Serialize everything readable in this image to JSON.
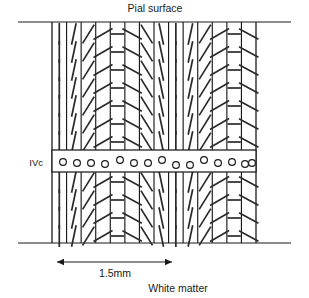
{
  "figure": {
    "title_top": "Pial surface",
    "title_bottom": "White matter",
    "layer_label": "IVc",
    "scale_label": "1.5mm",
    "colors": {
      "ink": "#1a1a1a",
      "tick": "#2a2a2a",
      "background": "#ffffff"
    }
  },
  "chart_data": {
    "type": "diagram",
    "xlabel": "1.5mm",
    "ylabel": "",
    "grid": false,
    "legend": null,
    "block": {
      "x_left": 52,
      "x_right": 256,
      "y_top": 22,
      "y_bottom": 243,
      "column_count": 14,
      "column_width_px": 14.57
    },
    "frame_lines": [
      {
        "name": "pial-surface-line",
        "x1": 18,
        "x2": 291,
        "y": 22
      },
      {
        "name": "white-matter-line",
        "x1": 18,
        "x2": 291,
        "y": 243
      }
    ],
    "ivc_band": {
      "y_top": 150,
      "y_bottom": 172,
      "circle_count": 15,
      "circle_radius_px": 3.4,
      "circle_cx": [
        63,
        77,
        91,
        105,
        120,
        134,
        148,
        162,
        176,
        190,
        204,
        218,
        232,
        245,
        252
      ],
      "circle_cy": [
        162,
        163,
        163,
        164,
        160,
        163,
        163,
        160,
        165,
        165,
        160,
        163,
        162,
        164,
        163
      ]
    },
    "orientation_columns": [
      {
        "index": 0,
        "angle_deg": 90,
        "label": "vertical"
      },
      {
        "index": 1,
        "angle_deg": 78,
        "label": "near-vertical"
      },
      {
        "index": 2,
        "angle_deg": 58,
        "label": "oblique-forward"
      },
      {
        "index": 3,
        "angle_deg": 30,
        "label": "shallow-forward"
      },
      {
        "index": 4,
        "angle_deg": 0,
        "label": "horizontal"
      },
      {
        "index": 5,
        "angle_deg": -28,
        "label": "shallow-back"
      },
      {
        "index": 6,
        "angle_deg": -58,
        "label": "oblique-back"
      },
      {
        "index": 7,
        "angle_deg": -78,
        "label": "near-vertical-back"
      },
      {
        "index": 8,
        "angle_deg": 90,
        "label": "vertical"
      },
      {
        "index": 9,
        "angle_deg": 78,
        "label": "near-vertical"
      },
      {
        "index": 10,
        "angle_deg": 58,
        "label": "oblique-forward"
      },
      {
        "index": 11,
        "angle_deg": 30,
        "label": "shallow-forward"
      },
      {
        "index": 12,
        "angle_deg": 0,
        "label": "horizontal"
      },
      {
        "index": 13,
        "angle_deg": -28,
        "label": "shallow-back"
      }
    ],
    "ticks_upper_y": [
      34,
      52,
      70,
      88,
      106,
      124,
      142
    ],
    "ticks_lower_y": [
      182,
      200,
      218,
      236
    ],
    "scale_bar": {
      "x_start": 57,
      "x_end": 172,
      "y": 262,
      "value_mm": 1.5,
      "label": "1.5mm"
    },
    "label_positions": {
      "pial_surface": {
        "x": 155,
        "y": 12,
        "anchor": "middle"
      },
      "ivc": {
        "x": 43,
        "y": 165,
        "anchor": "end"
      },
      "scale": {
        "x": 115,
        "y": 277,
        "anchor": "middle"
      },
      "white_matter": {
        "x": 178,
        "y": 292,
        "anchor": "middle"
      }
    }
  }
}
